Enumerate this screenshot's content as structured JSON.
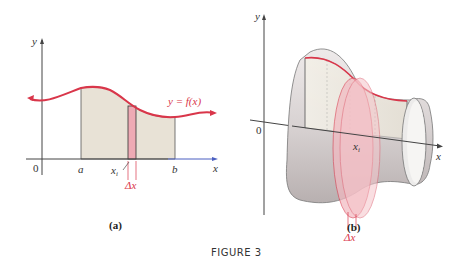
{
  "figure_caption": "FIGURE 3",
  "panel_a": {
    "caption": "(a)",
    "axis_x_label": "x",
    "axis_y_label": "y",
    "origin_label": "0",
    "label_a": "a",
    "label_b": "b",
    "label_xi": "x",
    "label_xi_sub": "i",
    "label_dx": "Δx",
    "curve_label": "y = f(x)"
  },
  "panel_b": {
    "caption": "(b)",
    "axis_x_label": "x",
    "axis_y_label": "y",
    "origin_label": "0",
    "label_xi": "x",
    "label_xi_sub": "i",
    "label_dx": "Δx"
  },
  "colors": {
    "curve": "#d9364a",
    "region_fill": "#e8e2d6",
    "slab_fill": "#eeaab4",
    "axis": "#444444",
    "x_axis_tail": "#4a5fc1",
    "solid_fill": "#d8d2d2"
  }
}
